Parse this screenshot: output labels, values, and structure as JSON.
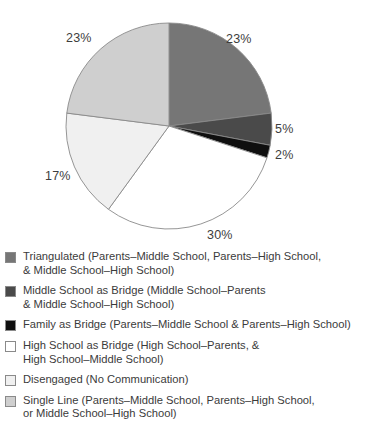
{
  "chart_data": {
    "type": "pie",
    "title": "",
    "legend_position": "bottom-left",
    "start_angle_deg": 0,
    "direction": "clockwise",
    "categories": [
      "Triangulated (Parents–Middle School, Parents–High School, & Middle School–High School)",
      "Middle School as Bridge (Middle School–Parents & Middle School–High School)",
      "Family as Bridge (Parents–Middle School & Parents–High School)",
      "High School as Bridge (High School–Parents, & High School–Middle School)",
      "Disengaged (No Communication)",
      "Single Line (Parents–Middle School, Parents–High School, or Middle School–High School)"
    ],
    "values": [
      23,
      5,
      2,
      30,
      17,
      23
    ],
    "value_labels": [
      "23%",
      "5%",
      "2%",
      "30%",
      "17%",
      "23%"
    ],
    "colors": [
      "#767676",
      "#4a4a4a",
      "#0f0f0f",
      "#ffffff",
      "#f0f0f0",
      "#cfcfcf"
    ],
    "slice_edge_color": "#8a8a8a"
  },
  "slices": [
    {
      "name": "triangulated",
      "label": "23%",
      "percent": 23,
      "color": "#767676",
      "label_x": 226,
      "label_y": 32
    },
    {
      "name": "middle-school-as-bridge",
      "label": "5%",
      "percent": 5,
      "color": "#4a4a4a",
      "label_x": 275,
      "label_y": 122
    },
    {
      "name": "family-as-bridge",
      "label": "2%",
      "percent": 2,
      "color": "#0f0f0f",
      "label_x": 275,
      "label_y": 148
    },
    {
      "name": "high-school-as-bridge",
      "label": "30%",
      "percent": 30,
      "color": "#ffffff",
      "label_x": 207,
      "label_y": 228
    },
    {
      "name": "disengaged",
      "label": "17%",
      "percent": 17,
      "color": "#f0f0f0",
      "label_x": 45,
      "label_y": 169
    },
    {
      "name": "single-line",
      "label": "23%",
      "percent": 23,
      "color": "#cfcfcf",
      "label_x": 66,
      "label_y": 31
    }
  ],
  "legend": {
    "items": [
      {
        "key": "triangulated",
        "swatch_color": "#767676",
        "line1": "Triangulated (Parents–Middle School, Parents–High School,",
        "line2": "& Middle School–High School)"
      },
      {
        "key": "middle-school-as-bridge",
        "swatch_color": "#4a4a4a",
        "line1": "Middle School as Bridge (Middle School–Parents",
        "line2": "& Middle School–High School)"
      },
      {
        "key": "family-as-bridge",
        "swatch_color": "#0f0f0f",
        "line1": "Family as Bridge (Parents–Middle School & Parents–High School)",
        "line2": ""
      },
      {
        "key": "high-school-as-bridge",
        "swatch_color": "#ffffff",
        "line1": "High School as Bridge (High School–Parents, &",
        "line2": "High School–Middle School)"
      },
      {
        "key": "disengaged",
        "swatch_color": "#f0f0f0",
        "line1": "Disengaged (No Communication)",
        "line2": ""
      },
      {
        "key": "single-line",
        "swatch_color": "#cfcfcf",
        "line1": "Single Line (Parents–Middle School, Parents–High School,",
        "line2": "or Middle School–High School)"
      }
    ]
  }
}
